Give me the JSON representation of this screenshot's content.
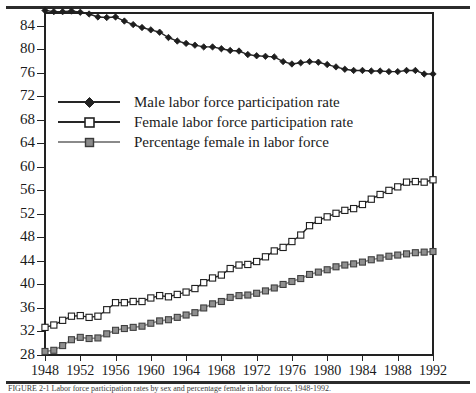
{
  "figure": {
    "caption": "FIGURE 2-1 Labor force participation rates by sex and percentage female in labor force, 1948-1992."
  },
  "chart_data": {
    "type": "line",
    "title": "",
    "xlabel": "",
    "ylabel": "",
    "xlim": [
      1948,
      1992
    ],
    "ylim": [
      28,
      86
    ],
    "grid": false,
    "legend_position": "inside-upper-left",
    "y_ticks": [
      28,
      32,
      36,
      40,
      44,
      48,
      52,
      56,
      60,
      64,
      68,
      72,
      76,
      80,
      84
    ],
    "x_ticks": [
      1948,
      1952,
      1956,
      1960,
      1964,
      1968,
      1972,
      1976,
      1980,
      1984,
      1988,
      1992
    ],
    "x": [
      1948,
      1949,
      1950,
      1951,
      1952,
      1953,
      1954,
      1955,
      1956,
      1957,
      1958,
      1959,
      1960,
      1961,
      1962,
      1963,
      1964,
      1965,
      1966,
      1967,
      1968,
      1969,
      1970,
      1971,
      1972,
      1973,
      1974,
      1975,
      1976,
      1977,
      1978,
      1979,
      1980,
      1981,
      1982,
      1983,
      1984,
      1985,
      1986,
      1987,
      1988,
      1989,
      1990,
      1991,
      1992
    ],
    "series": [
      {
        "name": "Male labor force participation rate",
        "color": "#262626",
        "marker": "filled-diamond",
        "values": [
          86.6,
          86.4,
          86.4,
          86.5,
          86.3,
          86.0,
          85.5,
          85.4,
          85.5,
          84.8,
          84.2,
          83.7,
          83.3,
          82.9,
          82.0,
          81.4,
          81.0,
          80.7,
          80.4,
          80.4,
          80.1,
          79.8,
          79.7,
          79.1,
          78.9,
          78.8,
          78.7,
          77.9,
          77.5,
          77.7,
          77.9,
          77.8,
          77.4,
          77.0,
          76.6,
          76.4,
          76.4,
          76.3,
          76.3,
          76.2,
          76.2,
          76.4,
          76.4,
          75.8,
          75.8
        ]
      },
      {
        "name": "Female labor force participation rate",
        "color": "#262626",
        "marker": "open-square",
        "values": [
          32.7,
          33.1,
          33.9,
          34.6,
          34.7,
          34.4,
          34.6,
          35.7,
          36.9,
          36.9,
          37.1,
          37.1,
          37.7,
          38.1,
          37.9,
          38.3,
          38.7,
          39.3,
          40.3,
          41.1,
          41.6,
          42.7,
          43.3,
          43.4,
          43.9,
          44.7,
          45.7,
          46.3,
          47.3,
          48.4,
          50.0,
          50.9,
          51.5,
          52.1,
          52.6,
          52.9,
          53.6,
          54.5,
          55.3,
          56.0,
          56.6,
          57.4,
          57.5,
          57.4,
          57.8
        ]
      },
      {
        "name": "Percentage female in labor force",
        "color": "#8a8a8a",
        "marker": "gray-square",
        "values": [
          28.6,
          28.8,
          29.6,
          30.6,
          31.0,
          30.8,
          30.9,
          31.6,
          32.2,
          32.5,
          32.7,
          32.9,
          33.4,
          33.8,
          34.0,
          34.4,
          34.8,
          35.2,
          36.0,
          36.7,
          37.1,
          37.8,
          38.1,
          38.2,
          38.5,
          38.9,
          39.4,
          40.0,
          40.5,
          41.0,
          41.7,
          42.1,
          42.5,
          43.0,
          43.3,
          43.5,
          43.8,
          44.2,
          44.5,
          44.8,
          45.0,
          45.2,
          45.4,
          45.5,
          45.6
        ]
      }
    ]
  }
}
